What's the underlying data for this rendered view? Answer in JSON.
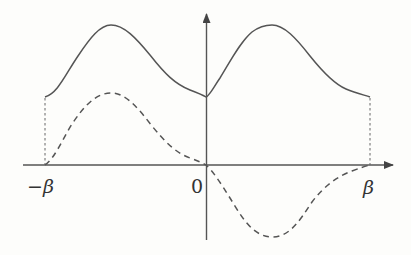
{
  "diagram": {
    "type": "function-plot",
    "axes": {
      "x_axis": {
        "has_arrow": true
      },
      "y_axis": {
        "has_arrow": true
      }
    },
    "labels": {
      "neg_beta": "−β",
      "origin": "0",
      "pos_beta": "β"
    },
    "curves": [
      {
        "name": "solid-curve",
        "style": "solid",
        "description": "positive even function with two peaks, minimum at origin, values at ±β equal"
      },
      {
        "name": "dashed-curve",
        "style": "dashed",
        "description": "odd function: positive hump on (−β,0), negative trough on (0,β), zero at −β, 0, β"
      }
    ],
    "guides": [
      {
        "name": "left-boundary",
        "style": "dotted",
        "at": "−β"
      },
      {
        "name": "right-boundary",
        "style": "dotted",
        "at": "β"
      }
    ],
    "colors": {
      "stroke": "#555555",
      "background": "#fdfdfb"
    }
  }
}
